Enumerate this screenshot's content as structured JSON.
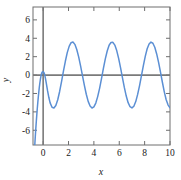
{
  "chart_data": {
    "type": "line",
    "title": "",
    "subtitle": "",
    "xlabel": "x",
    "ylabel": "y",
    "xlim": [
      -0.8,
      10
    ],
    "ylim": [
      -7.6,
      7.4
    ],
    "xticks": [
      0,
      2,
      4,
      6,
      8,
      10
    ],
    "xtick_labels": [
      "0",
      "2",
      "4",
      "6",
      "8",
      "10"
    ],
    "yticks": [
      -6,
      -4,
      -2,
      0,
      2,
      4,
      6
    ],
    "ytick_labels": [
      "-6",
      "-4",
      "-2",
      "0",
      "2",
      "4",
      "6"
    ],
    "grid": false,
    "legend": null,
    "series": [
      {
        "name": "curve",
        "color": "#5b8fd4",
        "linewidth": 1.5,
        "description": "Steeply rising branch from below -7 at x=-0.65, small peak just above y=0 at x=0.05, then a steady sinusoidal oscillation of amplitude about 3.6 and period about 3.15",
        "x": [
          -0.66,
          -0.62,
          -0.58,
          -0.54,
          -0.5,
          -0.46,
          -0.42,
          -0.38,
          -0.34,
          -0.3,
          -0.26,
          -0.22,
          -0.18,
          -0.14,
          -0.1,
          -0.06,
          -0.02,
          0.02,
          0.05,
          0.08,
          0.12,
          0.18,
          0.25,
          0.35,
          0.45,
          0.55,
          0.7,
          0.85,
          1.0,
          1.15,
          1.3,
          1.45,
          1.6,
          1.75,
          1.9,
          2.05,
          2.2,
          2.35,
          2.5,
          2.65,
          2.8,
          2.95,
          3.1,
          3.25,
          3.4,
          3.55,
          3.7,
          3.85,
          4.0,
          4.15,
          4.3,
          4.45,
          4.6,
          4.75,
          4.9,
          5.05,
          5.2,
          5.35,
          5.5,
          5.65,
          5.8,
          5.95,
          6.1,
          6.25,
          6.4,
          6.55,
          6.7,
          6.85,
          7.0,
          7.15,
          7.3,
          7.45,
          7.6,
          7.75,
          7.9,
          8.05,
          8.2,
          8.35,
          8.5,
          8.65,
          8.8,
          8.95,
          9.1,
          9.25,
          9.4,
          9.55,
          9.7,
          9.85,
          10.0
        ],
        "y": [
          -7.6,
          -6.7,
          -5.85,
          -5.05,
          -4.3,
          -3.6,
          -2.95,
          -2.35,
          -1.8,
          -1.3,
          -0.86,
          -0.48,
          -0.16,
          0.09,
          0.26,
          0.35,
          0.37,
          0.33,
          0.29,
          0.22,
          0.05,
          -0.35,
          -0.9,
          -1.72,
          -2.44,
          -3.02,
          -3.5,
          -3.58,
          -3.3,
          -2.68,
          -1.78,
          -0.72,
          0.42,
          1.5,
          2.44,
          3.12,
          3.52,
          3.6,
          3.34,
          2.78,
          1.98,
          1.0,
          -0.06,
          -1.12,
          -2.08,
          -2.86,
          -3.36,
          -3.58,
          -3.46,
          -3.04,
          -2.34,
          -1.44,
          -0.38,
          0.72,
          1.76,
          2.62,
          3.24,
          3.55,
          3.56,
          3.26,
          2.66,
          1.82,
          0.8,
          -0.28,
          -1.34,
          -2.28,
          -3.0,
          -3.44,
          -3.57,
          -3.38,
          -2.88,
          -2.1,
          -1.14,
          -0.06,
          1.02,
          2.04,
          2.86,
          3.38,
          3.58,
          3.46,
          3.02,
          2.3,
          1.38,
          0.32,
          -0.78,
          -1.82,
          -2.68,
          -3.26,
          -3.55
        ]
      }
    ]
  },
  "axes": {
    "x_title": "x",
    "y_title": "y"
  }
}
